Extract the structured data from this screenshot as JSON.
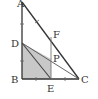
{
  "diagram": {
    "type": "geometry",
    "points": {
      "A": {
        "label": "A",
        "x": 22,
        "y": 2
      },
      "B": {
        "label": "B",
        "x": 22,
        "y": 79
      },
      "C": {
        "label": "C",
        "x": 79,
        "y": 79
      },
      "D": {
        "label": "D",
        "x": 22,
        "y": 43
      },
      "E": {
        "label": "E",
        "x": 51,
        "y": 79
      },
      "F": {
        "label": "F",
        "x": 51,
        "y": 37
      },
      "P": {
        "label": "P",
        "x": 51,
        "y": 59
      }
    },
    "segments": [
      "AB",
      "BC",
      "CA",
      "DC",
      "DE",
      "FE"
    ],
    "shaded_region": [
      "D",
      "B",
      "E",
      "P"
    ],
    "colors": {
      "line": "#333333",
      "shade": "#c8c8c8",
      "background": "#ffffff"
    }
  }
}
